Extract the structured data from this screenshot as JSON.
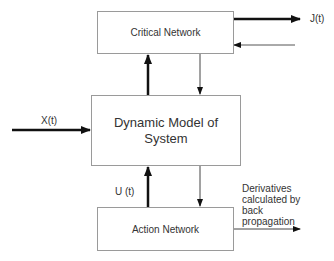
{
  "diagram": {
    "boxes": {
      "critical": "Critical Network",
      "dynamic": "Dynamic Model of System",
      "action": "Action Network"
    },
    "labels": {
      "jt": "J(t)",
      "xt": "X(t)",
      "ut": "U (t)",
      "derivatives": "Derivatives calculated by back propagation"
    }
  }
}
